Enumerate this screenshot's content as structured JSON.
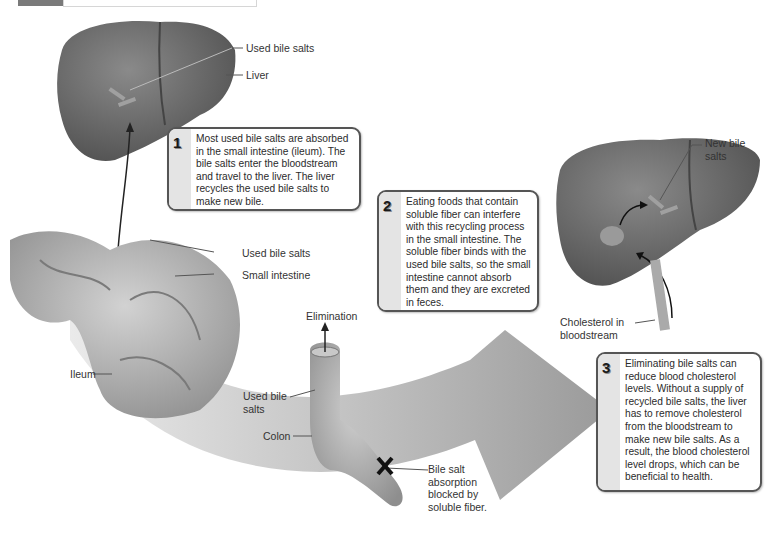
{
  "header": {
    "bar_present": true
  },
  "labels": {
    "used_bile_salts_liver": "Used bile salts",
    "liver": "Liver",
    "used_bile_salts_intestine": "Used bile salts",
    "small_intestine": "Small intestine",
    "ileum": "Ileum",
    "elimination": "Elimination",
    "used_bile_salts_colon": "Used bile salts",
    "colon": "Colon",
    "bile_salt_blocked": "Bile salt absorption blocked by soluble fiber.",
    "new_bile_salts": "New bile salts",
    "cholesterol_in_bloodstream": "Cholesterol in bloodstream"
  },
  "callouts": [
    {
      "number": "1",
      "text": "Most used bile salts are absorbed in the small intestine (ileum). The bile salts enter the bloodstream and travel to the liver. The liver recycles the used bile salts to make new bile."
    },
    {
      "number": "2",
      "text": "Eating foods that contain soluble fiber can interfere with this recycling process in the small intestine. The soluble fiber binds with the used bile salts, so the small intestine cannot absorb them and they are excreted in feces."
    },
    {
      "number": "3",
      "text": "Eliminating bile salts can reduce blood cholesterol levels. Without a supply of recycled bile salts, the liver has to remove cholesterol from the bloodstream to make new bile salts. As a result, the blood cholesterol level drops, which can be beneficial to health."
    }
  ],
  "colors": {
    "liver": "#5e5e5e",
    "intestine": "#b5b5b5",
    "arrow": "#8c8c8c",
    "callout_border": "#555555",
    "callout_strip": "#e4e4e4"
  }
}
